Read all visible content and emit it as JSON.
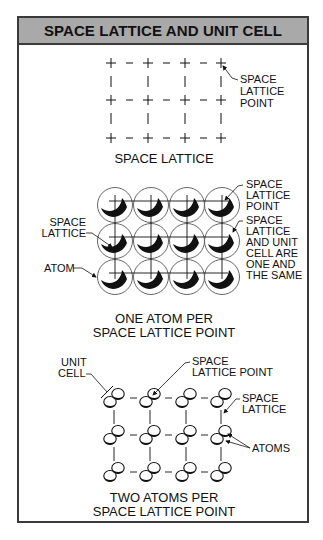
{
  "title": "SPACE LATTICE AND UNIT CELL",
  "panels": [
    {
      "caption": [
        "SPACE LATTICE"
      ],
      "callouts": [
        {
          "lines": [
            "SPACE",
            "LATTICE",
            "POINT"
          ]
        }
      ]
    },
    {
      "caption": [
        "ONE ATOM PER",
        "SPACE LATTICE POINT"
      ],
      "callouts": [
        {
          "lines": [
            "SPACE",
            "LATTICE",
            "POINT"
          ]
        },
        {
          "lines": [
            "SPACE",
            "LATTICE"
          ]
        },
        {
          "lines": [
            "SPACE",
            "LATTICE",
            "AND UNIT",
            "CELL ARE",
            "ONE AND",
            "THE SAME"
          ]
        },
        {
          "lines": [
            "ATOM"
          ]
        }
      ]
    },
    {
      "caption": [
        "TWO ATOMS PER",
        "SPACE LATTICE POINT"
      ],
      "callouts": [
        {
          "lines": [
            "UNIT",
            "CELL"
          ]
        },
        {
          "lines": [
            "SPACE",
            "LATTICE POINT"
          ]
        },
        {
          "lines": [
            "SPACE",
            "LATTICE"
          ]
        },
        {
          "lines": [
            "ATOMS"
          ]
        }
      ]
    }
  ],
  "colors": {
    "header_bg": "#a9a9a9",
    "border": "#3a3a3a",
    "ink": "#111111"
  }
}
